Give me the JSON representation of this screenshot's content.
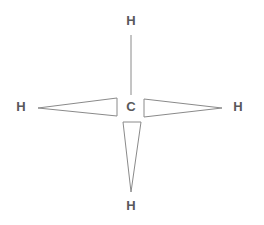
{
  "diagram": {
    "molecule": "CH4",
    "background_color": "#ffffff",
    "bond_stroke_color": "#8a8a8a",
    "label_color": "#59595b",
    "bond_stroke_width": 1,
    "center_atom": {
      "symbol": "C",
      "name": "carbon",
      "x": 131,
      "y": 106
    },
    "atoms": [
      {
        "id": "h-top",
        "symbol": "H",
        "name": "hydrogen-top",
        "x": 131,
        "y": 20
      },
      {
        "id": "h-left",
        "symbol": "H",
        "name": "hydrogen-left",
        "x": 21,
        "y": 106
      },
      {
        "id": "h-right",
        "symbol": "H",
        "name": "hydrogen-right",
        "x": 238,
        "y": 106
      },
      {
        "id": "h-bottom",
        "symbol": "H",
        "name": "hydrogen-bottom",
        "x": 131,
        "y": 205
      }
    ],
    "bonds": [
      {
        "id": "bond-top",
        "from": "C",
        "to": "h-top",
        "style": "plain-line",
        "geometry": {
          "x1": 131,
          "y1": 95,
          "x2": 131,
          "y2": 35
        }
      },
      {
        "id": "bond-left",
        "from": "C",
        "to": "h-left",
        "style": "hollow-wedge",
        "direction": "apex-outward",
        "geometry": {
          "points": "117,98 117,116 38,108"
        }
      },
      {
        "id": "bond-right",
        "from": "C",
        "to": "h-right",
        "style": "hollow-wedge",
        "direction": "apex-outward",
        "geometry": {
          "points": "144,99 144,117 222,108"
        }
      },
      {
        "id": "bond-bottom",
        "from": "C",
        "to": "h-bottom",
        "style": "hollow-wedge",
        "direction": "apex-outward",
        "geometry": {
          "points": "123,122 141,122 131,192"
        }
      }
    ]
  }
}
